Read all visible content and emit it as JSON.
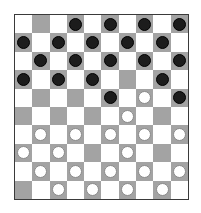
{
  "game": "international-draughts",
  "board": {
    "size": 10,
    "colors": {
      "dark_square": "#a3a3a3",
      "light_square": "#ffffff",
      "border": "#3a3a3a",
      "black_piece": "#1c1c1c",
      "white_piece": "#ffffff"
    },
    "rows": [
      [
        "",
        "",
        "",
        "b",
        "",
        "b",
        "",
        "b",
        "",
        "b"
      ],
      [
        "b",
        "",
        "b",
        "",
        "b",
        "",
        "b",
        "",
        "b",
        ""
      ],
      [
        "",
        "b",
        "",
        "b",
        "",
        "b",
        "",
        "b",
        "",
        "b"
      ],
      [
        "b",
        "",
        "b",
        "",
        "b",
        "",
        "",
        "",
        "b",
        ""
      ],
      [
        "",
        "",
        "",
        "",
        "",
        "b",
        "",
        "w",
        "",
        "b"
      ],
      [
        "",
        "",
        "",
        "",
        "",
        "",
        "w",
        "",
        "",
        ""
      ],
      [
        "",
        "w",
        "",
        "w",
        "",
        "w",
        "",
        "w",
        "",
        "w"
      ],
      [
        "w",
        "",
        "w",
        "",
        "",
        "",
        "w",
        "",
        "",
        ""
      ],
      [
        "",
        "w",
        "",
        "w",
        "",
        "w",
        "",
        "w",
        "",
        "w"
      ],
      [
        "",
        "",
        "w",
        "",
        "w",
        "",
        "w",
        "",
        "w",
        ""
      ]
    ]
  },
  "counts": {
    "black": 18,
    "white": 18
  }
}
